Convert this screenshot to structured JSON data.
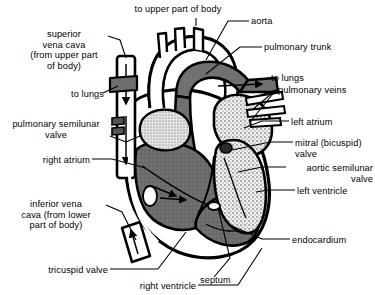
{
  "diagram": {
    "type": "anatomical-illustration",
    "colors": {
      "background": "#ffffff",
      "outline": "#000000",
      "deoxygenated_chamber": "#6e6e6e",
      "oxygenated_chamber": "#d8d8d8",
      "vessel_dark": "#707070",
      "vessel_light": "#ffffff",
      "text": "#000000"
    },
    "labels": [
      {
        "id": "to-upper-part-of-body",
        "text": "to upper part of body",
        "align": "center",
        "x": 118,
        "y": 4,
        "w": 120
      },
      {
        "id": "aorta",
        "text": "aorta",
        "align": "left",
        "x": 251,
        "y": 16,
        "w": 60
      },
      {
        "id": "superior-vena-cava",
        "text": "superior\nvena cava\n(from upper part\nof body)",
        "align": "center",
        "x": 12,
        "y": 29,
        "w": 104
      },
      {
        "id": "pulmonary-trunk",
        "text": "pulmonary trunk",
        "align": "left",
        "x": 264,
        "y": 42,
        "w": 100
      },
      {
        "id": "to-lungs-left",
        "text": "to lungs",
        "align": "right",
        "x": 38,
        "y": 89,
        "w": 72
      },
      {
        "id": "to-lungs-right",
        "text": "to lungs",
        "align": "left",
        "x": 271,
        "y": 73,
        "w": 60
      },
      {
        "id": "pulmonary-veins",
        "text": "pulmonary veins",
        "align": "left",
        "x": 278,
        "y": 85,
        "w": 95
      },
      {
        "id": "left-atrium",
        "text": "left atrium",
        "align": "left",
        "x": 291,
        "y": 117,
        "w": 70
      },
      {
        "id": "pulmonary-semilunar-valve",
        "text": "pulmonary semilunar\nvalve",
        "align": "center",
        "x": 2,
        "y": 119,
        "w": 112
      },
      {
        "id": "mitral-bicuspid-valve",
        "text": "mitral (bicuspid)\nvalve",
        "align": "left",
        "x": 295,
        "y": 138,
        "w": 80
      },
      {
        "id": "right-atrium",
        "text": "right atrium",
        "align": "right",
        "x": 12,
        "y": 155,
        "w": 78
      },
      {
        "id": "aortic-semilunar-valve",
        "text": "aortic semilunar\nvalve",
        "align": "right",
        "x": 288,
        "y": 163,
        "w": 85
      },
      {
        "id": "left-ventricle",
        "text": "left ventricle",
        "align": "left",
        "x": 297,
        "y": 186,
        "w": 78
      },
      {
        "id": "inferior-vena-cava",
        "text": "inferior vena\ncava (from lower\npart of body)",
        "align": "center",
        "x": 6,
        "y": 199,
        "w": 104
      },
      {
        "id": "endocardium",
        "text": "endocardium",
        "align": "left",
        "x": 292,
        "y": 235,
        "w": 82
      },
      {
        "id": "tricuspid-valve",
        "text": "tricuspid valve",
        "align": "right",
        "x": 20,
        "y": 265,
        "w": 88
      },
      {
        "id": "septum",
        "text": "septum",
        "align": "left",
        "x": 200,
        "y": 275,
        "w": 56
      },
      {
        "id": "right-ventricle",
        "text": "right ventricle",
        "align": "right",
        "x": 106,
        "y": 281,
        "w": 90
      }
    ],
    "structures": [
      {
        "id": "aortic-arch",
        "name": "aorta",
        "blood": "oxygenated"
      },
      {
        "id": "brachiocephalic-branches",
        "name": "to upper part of body",
        "count": 3
      },
      {
        "id": "pulmonary-trunk",
        "name": "pulmonary trunk",
        "blood": "deoxygenated"
      },
      {
        "id": "superior-vena-cava-tube",
        "name": "superior vena cava",
        "flow": "down",
        "arrows": 2
      },
      {
        "id": "inferior-vena-cava-tube",
        "name": "inferior vena cava",
        "flow": "up",
        "arrows": 1
      },
      {
        "id": "right-atrium-chamber",
        "name": "right atrium",
        "blood": "deoxygenated"
      },
      {
        "id": "right-ventricle-chamber",
        "name": "right ventricle",
        "blood": "deoxygenated"
      },
      {
        "id": "left-atrium-chamber",
        "name": "left atrium",
        "blood": "oxygenated"
      },
      {
        "id": "left-ventricle-chamber",
        "name": "left ventricle",
        "blood": "oxygenated"
      },
      {
        "id": "interventricular-septum",
        "name": "septum"
      },
      {
        "id": "endocardium-lining",
        "name": "endocardium"
      }
    ]
  }
}
